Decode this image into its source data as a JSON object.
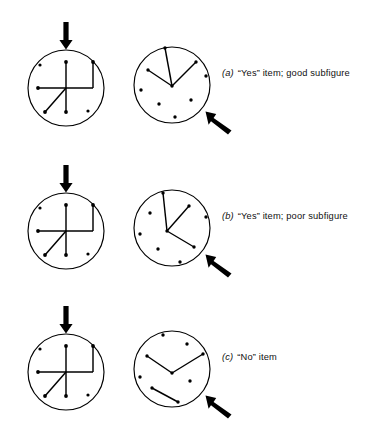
{
  "figure": {
    "background_color": "#ffffff",
    "ink_color": "#000000",
    "width": 387,
    "height": 439
  },
  "rows": [
    {
      "id": "a",
      "caption_id": "(a)",
      "caption_text": "“Yes” item; good subfigure",
      "complex_figure": {
        "name": "complex-figure-H",
        "circle": {
          "cx": 66,
          "cy": 88,
          "r": 38
        },
        "lines": [
          {
            "name": "vertical-stem",
            "x1": 66,
            "y1": 62,
            "x2": 66,
            "y2": 112
          },
          {
            "name": "horizontal-bar",
            "x1": 38,
            "y1": 88,
            "x2": 93,
            "y2": 88
          },
          {
            "name": "right-vertical",
            "x1": 93,
            "y1": 62,
            "x2": 93,
            "y2": 88
          },
          {
            "name": "diagonal-lower-left",
            "x1": 66,
            "y1": 88,
            "x2": 45,
            "y2": 112
          }
        ],
        "dots": [
          {
            "name": "dot-top-left",
            "cx": 40,
            "cy": 65
          },
          {
            "name": "dot-top-stem",
            "cx": 66,
            "cy": 62
          },
          {
            "name": "dot-top-right",
            "cx": 93,
            "cy": 62
          },
          {
            "name": "dot-left-bar",
            "cx": 38,
            "cy": 88
          },
          {
            "name": "dot-bottom-stem",
            "cx": 66,
            "cy": 112
          },
          {
            "name": "dot-diagonal-end",
            "cx": 45,
            "cy": 112
          },
          {
            "name": "dot-bottom-right",
            "cx": 88,
            "cy": 111
          }
        ],
        "arrow": {
          "name": "down-arrow",
          "x": 66,
          "y_tail": 22,
          "y_head": 48
        }
      },
      "simple_figure": {
        "name": "simple-figure-3-spoke",
        "circle": {
          "cx": 172,
          "cy": 85,
          "r": 38
        },
        "lines": [
          {
            "name": "spoke-up",
            "x1": 172,
            "y1": 86,
            "x2": 165,
            "y2": 48
          },
          {
            "name": "spoke-upper-right",
            "x1": 172,
            "y1": 86,
            "x2": 196,
            "y2": 62
          },
          {
            "name": "spoke-left",
            "x1": 172,
            "y1": 86,
            "x2": 148,
            "y2": 70
          }
        ],
        "dots": [
          {
            "name": "dot-spoke-up-end",
            "cx": 165,
            "cy": 48
          },
          {
            "name": "dot-spoke-right-end",
            "cx": 196,
            "cy": 62
          },
          {
            "name": "dot-spoke-left-end",
            "cx": 148,
            "cy": 70
          },
          {
            "name": "dot-center",
            "cx": 172,
            "cy": 86
          },
          {
            "name": "dot-right",
            "cx": 206,
            "cy": 76
          },
          {
            "name": "dot-far-left",
            "cx": 141,
            "cy": 90
          },
          {
            "name": "dot-lower-left",
            "cx": 159,
            "cy": 104
          },
          {
            "name": "dot-lower-right",
            "cx": 191,
            "cy": 100
          },
          {
            "name": "dot-bottom",
            "cx": 175,
            "cy": 117
          }
        ],
        "arrow": {
          "name": "diagonal-arrow",
          "tail_x": 232,
          "tail_y": 131,
          "head_x": 206,
          "head_y": 112
        }
      }
    },
    {
      "id": "b",
      "caption_id": "(b)",
      "caption_text": "“Yes” item; poor subfigure",
      "complex_figure": {
        "name": "complex-figure-H",
        "circle": {
          "cx": 66,
          "cy": 88,
          "r": 38
        },
        "lines": [
          {
            "name": "vertical-stem",
            "x1": 66,
            "y1": 62,
            "x2": 66,
            "y2": 112
          },
          {
            "name": "horizontal-bar",
            "x1": 38,
            "y1": 88,
            "x2": 93,
            "y2": 88
          },
          {
            "name": "right-vertical",
            "x1": 93,
            "y1": 62,
            "x2": 93,
            "y2": 88
          },
          {
            "name": "diagonal-lower-left",
            "x1": 66,
            "y1": 88,
            "x2": 45,
            "y2": 112
          }
        ],
        "dots": [
          {
            "name": "dot-top-left",
            "cx": 40,
            "cy": 65
          },
          {
            "name": "dot-top-stem",
            "cx": 66,
            "cy": 62
          },
          {
            "name": "dot-top-right",
            "cx": 93,
            "cy": 62
          },
          {
            "name": "dot-left-bar",
            "cx": 38,
            "cy": 88
          },
          {
            "name": "dot-bottom-stem",
            "cx": 66,
            "cy": 112
          },
          {
            "name": "dot-diagonal-end",
            "cx": 45,
            "cy": 112
          },
          {
            "name": "dot-bottom-right",
            "cx": 88,
            "cy": 111
          }
        ],
        "arrow": {
          "name": "down-arrow",
          "x": 66,
          "y_tail": 22,
          "y_head": 48
        }
      },
      "simple_figure": {
        "name": "simple-figure-3-spoke-rotated",
        "circle": {
          "cx": 172,
          "cy": 85,
          "r": 38
        },
        "lines": [
          {
            "name": "spoke-up",
            "x1": 167,
            "y1": 88,
            "x2": 163,
            "y2": 50
          },
          {
            "name": "spoke-upper-right",
            "x1": 167,
            "y1": 88,
            "x2": 189,
            "y2": 63
          },
          {
            "name": "spoke-lower-right",
            "x1": 167,
            "y1": 88,
            "x2": 194,
            "y2": 104
          }
        ],
        "dots": [
          {
            "name": "dot-spoke-up-end",
            "cx": 163,
            "cy": 50
          },
          {
            "name": "dot-spoke-upper-right-end",
            "cx": 189,
            "cy": 63
          },
          {
            "name": "dot-spoke-lower-right-end",
            "cx": 194,
            "cy": 104
          },
          {
            "name": "dot-center",
            "cx": 167,
            "cy": 88
          },
          {
            "name": "dot-upper-left",
            "cx": 150,
            "cy": 70
          },
          {
            "name": "dot-right",
            "cx": 206,
            "cy": 74
          },
          {
            "name": "dot-far-left",
            "cx": 140,
            "cy": 91
          },
          {
            "name": "dot-lower-left",
            "cx": 158,
            "cy": 106
          },
          {
            "name": "dot-bottom",
            "cx": 180,
            "cy": 119
          }
        ],
        "arrow": {
          "name": "diagonal-arrow",
          "tail_x": 232,
          "tail_y": 131,
          "head_x": 206,
          "head_y": 112
        }
      }
    },
    {
      "id": "c",
      "caption_id": "(c)",
      "caption_text": "“No” item",
      "complex_figure": {
        "name": "complex-figure-H",
        "circle": {
          "cx": 66,
          "cy": 88,
          "r": 38
        },
        "lines": [
          {
            "name": "vertical-stem",
            "x1": 66,
            "y1": 62,
            "x2": 66,
            "y2": 112
          },
          {
            "name": "horizontal-bar",
            "x1": 38,
            "y1": 88,
            "x2": 93,
            "y2": 88
          },
          {
            "name": "right-vertical",
            "x1": 93,
            "y1": 62,
            "x2": 93,
            "y2": 88
          },
          {
            "name": "diagonal-lower-left",
            "x1": 66,
            "y1": 88,
            "x2": 45,
            "y2": 112
          }
        ],
        "dots": [
          {
            "name": "dot-top-left",
            "cx": 40,
            "cy": 65
          },
          {
            "name": "dot-top-stem",
            "cx": 66,
            "cy": 62
          },
          {
            "name": "dot-top-right",
            "cx": 93,
            "cy": 62
          },
          {
            "name": "dot-left-bar",
            "cx": 38,
            "cy": 88
          },
          {
            "name": "dot-bottom-stem",
            "cx": 66,
            "cy": 112
          },
          {
            "name": "dot-diagonal-end",
            "cx": 45,
            "cy": 112
          },
          {
            "name": "dot-bottom-right",
            "cx": 88,
            "cy": 111
          }
        ],
        "arrow": {
          "name": "down-arrow",
          "x": 66,
          "y_tail": 22,
          "y_head": 48
        }
      },
      "simple_figure": {
        "name": "simple-figure-chevron-and-segment",
        "circle": {
          "cx": 172,
          "cy": 85,
          "r": 38
        },
        "lines": [
          {
            "name": "chevron-left-arm",
            "x1": 147,
            "y1": 72,
            "x2": 172,
            "y2": 89
          },
          {
            "name": "chevron-right-arm",
            "x1": 172,
            "y1": 89,
            "x2": 203,
            "y2": 70
          },
          {
            "name": "detached-segment",
            "x1": 152,
            "y1": 104,
            "x2": 178,
            "y2": 118
          }
        ],
        "dots": [
          {
            "name": "dot-chevron-left-end",
            "cx": 147,
            "cy": 72
          },
          {
            "name": "dot-chevron-vertex",
            "cx": 172,
            "cy": 89
          },
          {
            "name": "dot-chevron-right-end",
            "cx": 203,
            "cy": 70
          },
          {
            "name": "dot-segment-start",
            "cx": 152,
            "cy": 104
          },
          {
            "name": "dot-segment-end",
            "cx": 178,
            "cy": 118
          },
          {
            "name": "dot-top",
            "cx": 163,
            "cy": 51
          },
          {
            "name": "dot-top-right",
            "cx": 187,
            "cy": 60
          },
          {
            "name": "dot-far-left",
            "cx": 140,
            "cy": 93
          },
          {
            "name": "dot-mid-right",
            "cx": 190,
            "cy": 97
          }
        ],
        "arrow": {
          "name": "diagonal-arrow",
          "tail_x": 232,
          "tail_y": 131,
          "head_x": 206,
          "head_y": 112
        }
      }
    }
  ]
}
